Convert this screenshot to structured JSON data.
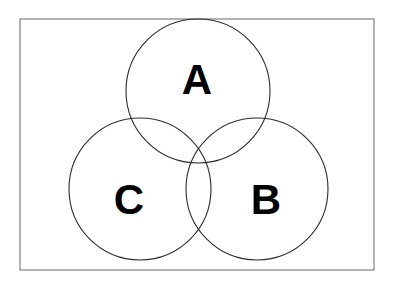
{
  "figure": {
    "name": "three-set-venn-diagram",
    "type": "venn-diagram",
    "width": 393,
    "height": 287,
    "background_color": "#ffffff"
  },
  "frame": {
    "x": 20,
    "y": 19,
    "width": 354,
    "height": 251,
    "stroke_color": "#8a8a8a",
    "stroke_width": 1.3,
    "fill": "none"
  },
  "style": {
    "circle_stroke_color": "#2b2b2b",
    "circle_stroke_width": 1.1,
    "circle_fill": "none",
    "label_color": "#000000",
    "label_font_size": 42
  },
  "sets": [
    {
      "id": "set-a",
      "label": "A",
      "cx": 198,
      "cy": 91,
      "r": 72,
      "label_x": 197,
      "label_y": 79
    },
    {
      "id": "set-c",
      "label": "C",
      "cx": 140,
      "cy": 189,
      "r": 71,
      "label_x": 129,
      "label_y": 199
    },
    {
      "id": "set-b",
      "label": "B",
      "cx": 257,
      "cy": 189,
      "r": 71,
      "label_x": 266,
      "label_y": 199
    }
  ],
  "chart_data": {
    "type": "venn",
    "title": "",
    "xlabel": "",
    "ylabel": "",
    "set_labels": [
      "A",
      "C",
      "B"
    ],
    "set_count": 3,
    "regions": [
      "A only",
      "B only",
      "C only",
      "A ∩ B",
      "A ∩ C",
      "B ∩ C",
      "A ∩ B ∩ C",
      "outside all sets"
    ],
    "region_values": [
      null,
      null,
      null,
      null,
      null,
      null,
      null,
      null
    ],
    "values_shown": false,
    "grid": false,
    "legend": "none"
  }
}
